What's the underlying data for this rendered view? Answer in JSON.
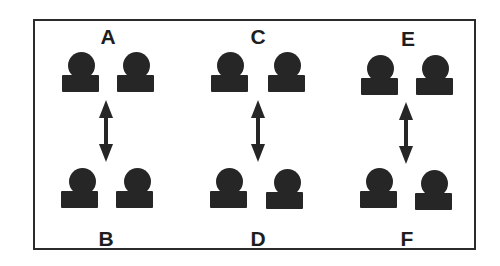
{
  "diagram": {
    "title": "",
    "colors": {
      "ink": "#262626",
      "frame": "#2b2b2b",
      "background": "#ffffff"
    },
    "panels": [
      {
        "label": "A",
        "position": "top",
        "group": 1,
        "figures": 2
      },
      {
        "label": "B",
        "position": "bottom",
        "group": 1,
        "figures": 2
      },
      {
        "label": "C",
        "position": "top",
        "group": 2,
        "figures": 2
      },
      {
        "label": "D",
        "position": "bottom",
        "group": 2,
        "figures": 2
      },
      {
        "label": "E",
        "position": "top",
        "group": 3,
        "figures": 2
      },
      {
        "label": "F",
        "position": "bottom",
        "group": 3,
        "figures": 2
      }
    ],
    "connectors": [
      {
        "from": "A",
        "to": "B",
        "type": "double-headed-arrow"
      },
      {
        "from": "C",
        "to": "D",
        "type": "double-headed-arrow"
      },
      {
        "from": "E",
        "to": "F",
        "type": "double-headed-arrow"
      }
    ],
    "figure_shape": "circle-on-rectangle"
  }
}
